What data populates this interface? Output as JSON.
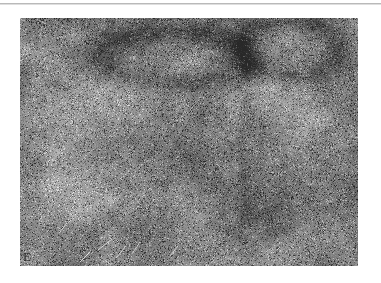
{
  "page": {
    "background_color": "#ffffff",
    "rule_color": "#b9b9b9"
  },
  "figure": {
    "panel_letter": "E",
    "caption": "",
    "kind": "histology-micrograph",
    "modality": "light-microscopy",
    "staining": "grayscale",
    "base_tone": "#8b8b8b",
    "light_tone": "#c2c2c2",
    "dark_tone": "#4a4a4a",
    "bounds": {
      "x": 20,
      "y": 18,
      "width": 338,
      "height": 248
    },
    "features": [
      {
        "name": "dark-arc-band-upper-center",
        "cx": 0.46,
        "cy": 0.16,
        "rx": 0.26,
        "ry": 0.12
      },
      {
        "name": "dark-arc-band-upper-right",
        "cx": 0.8,
        "cy": 0.12,
        "rx": 0.16,
        "ry": 0.13
      },
      {
        "name": "pale-nodule-left",
        "cx": 0.17,
        "cy": 0.33,
        "rx": 0.13,
        "ry": 0.15
      },
      {
        "name": "pale-nodule-center",
        "cx": 0.36,
        "cy": 0.3,
        "rx": 0.12,
        "ry": 0.13
      },
      {
        "name": "bright-band-right",
        "cx": 0.78,
        "cy": 0.32,
        "rx": 0.12,
        "ry": 0.26
      },
      {
        "name": "dark-cell-dense-region-center",
        "cx": 0.52,
        "cy": 0.52,
        "rx": 0.24,
        "ry": 0.22
      },
      {
        "name": "dark-cell-dense-region-lower-right",
        "cx": 0.72,
        "cy": 0.78,
        "rx": 0.18,
        "ry": 0.18
      },
      {
        "name": "pale-region-lower-left",
        "cx": 0.14,
        "cy": 0.7,
        "rx": 0.14,
        "ry": 0.18
      },
      {
        "name": "vertical-seam-right",
        "cx": 0.66,
        "cy": 0.5,
        "rx": 0.02,
        "ry": 0.48
      }
    ]
  }
}
